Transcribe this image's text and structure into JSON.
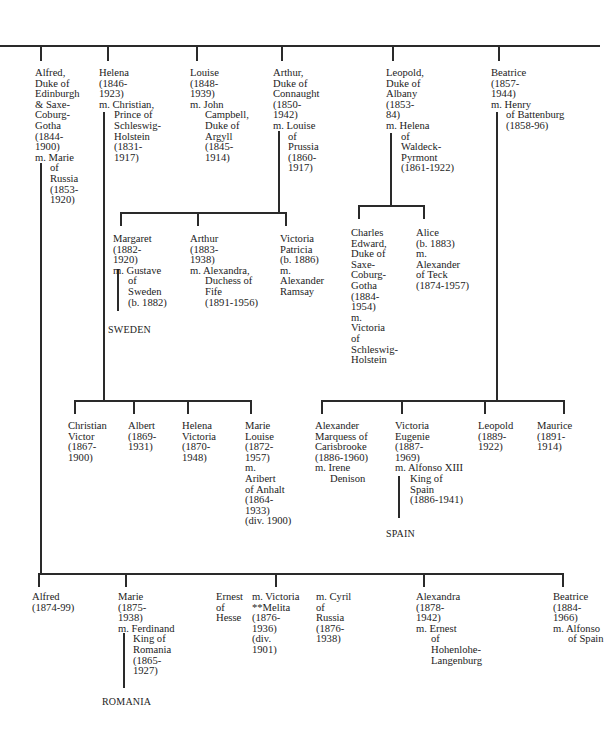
{
  "generation1": [
    {
      "id": "alfred-edinburgh",
      "lines": [
        "Alfred,",
        "Duke of",
        "Edinburgh",
        "& Saxe-",
        "Coburg-",
        "Gotha",
        "(1844-",
        "1900)"
      ],
      "spouse": [
        "m. Marie",
        "of",
        "Russia",
        "(1853-",
        "1920)"
      ]
    },
    {
      "id": "helena",
      "lines": [
        "Helena",
        "(1846-",
        "1923)"
      ],
      "spouse": [
        "m. Christian,",
        "Prince of",
        "Schleswig-",
        "Holstein",
        "(1831-",
        "1917)"
      ]
    },
    {
      "id": "louise",
      "lines": [
        "Louise",
        "(1848-",
        "1939)"
      ],
      "spouse": [
        "m. John",
        "Campbell,",
        "Duke of",
        "Argyll",
        "(1845-",
        "1914)"
      ]
    },
    {
      "id": "arthur-connaught",
      "lines": [
        "Arthur,",
        "Duke of",
        "Connaught",
        "(1850-",
        "1942)"
      ],
      "spouse": [
        "m. Louise",
        "of",
        "Prussia",
        "(1860-",
        "1917)"
      ]
    },
    {
      "id": "leopold-albany",
      "lines": [
        "Leopold,",
        "Duke of",
        "Albany",
        "(1853-",
        "84)"
      ],
      "spouse": [
        "m. Helena",
        "of",
        "Waldeck-",
        "Pyrmont",
        "(1861-1922)"
      ]
    },
    {
      "id": "beatrice",
      "lines": [
        "Beatrice",
        "(1857-",
        "1944)"
      ],
      "spouse": [
        "m. Henry",
        "of Battenburg",
        "(1858-96)"
      ]
    }
  ],
  "arthur_children": [
    {
      "id": "margaret",
      "lines": [
        "Margaret",
        "(1882-",
        "1920)"
      ],
      "spouse": [
        "m. Gustave",
        "of",
        "Sweden",
        "(b. 1882)"
      ]
    },
    {
      "id": "arthur-jr",
      "lines": [
        "Arthur",
        "(1883-",
        "1938)"
      ],
      "spouse": [
        "m. Alexandra,",
        "Duchess of",
        "Fife",
        "(1891-1956)"
      ]
    },
    {
      "id": "victoria-patricia",
      "lines": [
        "Victoria",
        "Patricia",
        "(b. 1886)",
        "m.",
        "Alexander",
        "Ramsay"
      ]
    }
  ],
  "leopold_children": [
    {
      "id": "charles-edward",
      "lines": [
        "Charles",
        "Edward,",
        "Duke of",
        "Saxe-",
        "Coburg-",
        "Gotha",
        "(1884-",
        "1954)",
        "m.",
        "Victoria",
        "of",
        "Schleswig-",
        "Holstein"
      ]
    },
    {
      "id": "alice",
      "lines": [
        "Alice",
        "(b. 1883)",
        "m.",
        "Alexander",
        "of Teck",
        "(1874-1957)"
      ]
    }
  ],
  "helena_children": [
    {
      "id": "christian-victor",
      "lines": [
        "Christian",
        "Victor",
        "(1867-",
        "1900)"
      ]
    },
    {
      "id": "albert",
      "lines": [
        "Albert",
        "(1869-",
        "1931)"
      ]
    },
    {
      "id": "helena-victoria",
      "lines": [
        "Helena",
        "Victoria",
        "(1870-",
        "1948)"
      ]
    },
    {
      "id": "marie-louise",
      "lines": [
        "Marie",
        "Louise",
        "(1872-",
        "1957)",
        "m.",
        "Aribert",
        "of Anhalt",
        "(1864-",
        "1933)",
        "(div. 1900)"
      ]
    }
  ],
  "beatrice_children": [
    {
      "id": "alexander-carisbrooke",
      "lines": [
        "Alexander",
        "Marquess of",
        "Carisbrooke",
        "(1886-1960)"
      ],
      "spouse": [
        "m. Irene",
        "Denison"
      ]
    },
    {
      "id": "victoria-eugenie",
      "lines": [
        "Victoria",
        "Eugenie",
        "(1887-",
        "1969)"
      ],
      "spouse": [
        "m. Alfonso XIII",
        "King of",
        "Spain",
        "(1886-1941)"
      ]
    },
    {
      "id": "leopold-jr",
      "lines": [
        "Leopold",
        "(1889-",
        "1922)"
      ]
    },
    {
      "id": "maurice",
      "lines": [
        "Maurice",
        "(1891-",
        "1914)"
      ]
    }
  ],
  "alfred_children": [
    {
      "id": "alfred-jr",
      "lines": [
        "Alfred",
        "(1874-99)"
      ]
    },
    {
      "id": "marie",
      "lines": [
        "Marie",
        "(1875-",
        "1938)"
      ],
      "spouse": [
        "m. Ferdinand",
        "King of",
        "Romania",
        "(1865-",
        "1927)"
      ]
    },
    {
      "id": "ernest-hesse",
      "lines": [
        "Ernest",
        "of",
        "Hesse"
      ]
    },
    {
      "id": "victoria-melita",
      "lines": [
        "m. Victoria",
        "**Melita",
        "(1876-",
        "1936)",
        "(div.",
        "1901)"
      ]
    },
    {
      "id": "cyril",
      "lines": [
        "m. Cyril",
        "of",
        "Russia",
        "(1876-",
        "1938)"
      ]
    },
    {
      "id": "alexandra",
      "lines": [
        "Alexandra",
        "(1878-",
        "1942)"
      ],
      "spouse": [
        "m. Ernest",
        "of",
        "Hohenlohe-",
        "Langenburg"
      ]
    },
    {
      "id": "beatrice-jr",
      "lines": [
        "Beatrice",
        "(1884-",
        "1966)"
      ],
      "spouse": [
        "m. Alfonso",
        "of Spain"
      ]
    }
  ],
  "countries": {
    "sweden": "SWEDEN",
    "spain": "SPAIN",
    "romania": "ROMANIA"
  }
}
